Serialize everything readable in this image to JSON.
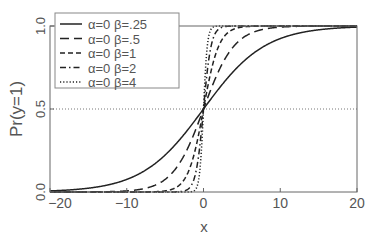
{
  "chart_data": {
    "type": "line",
    "title": "",
    "xlabel": "x",
    "ylabel": "Pr(y=1)",
    "xlim": [
      -20,
      20
    ],
    "ylim": [
      0,
      1
    ],
    "xticks": [
      -20,
      -10,
      0,
      10,
      20
    ],
    "xtick_labels": [
      "−20",
      "−10",
      "0",
      "10",
      "20"
    ],
    "yticks": [
      0.0,
      0.5,
      1.0
    ],
    "ytick_labels": [
      "0.0",
      "0.5",
      "1.0"
    ],
    "grid": false,
    "reference_line": {
      "y": 0.5,
      "style": "dotted"
    },
    "legend_position": "upper left",
    "function": "logistic: 1/(1+exp(-(alpha+beta*x)))",
    "series": [
      {
        "name": "α=0  β=.25",
        "alpha": 0,
        "beta": 0.25,
        "style": "solid"
      },
      {
        "name": "α=0  β=.5",
        "alpha": 0,
        "beta": 0.5,
        "style": "longdash"
      },
      {
        "name": "α=0  β=1",
        "alpha": 0,
        "beta": 1,
        "style": "dash"
      },
      {
        "name": "α=0  β=2",
        "alpha": 0,
        "beta": 2,
        "style": "dashdot"
      },
      {
        "name": "α=0  β=4",
        "alpha": 0,
        "beta": 4,
        "style": "dotted"
      }
    ]
  }
}
